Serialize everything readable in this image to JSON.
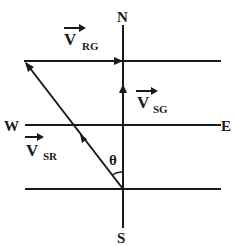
{
  "diagram": {
    "compass": {
      "north": "N",
      "south": "S",
      "east": "E",
      "west": "W"
    },
    "vectors": {
      "v_rg": {
        "letter": "V",
        "subscript": "RG"
      },
      "v_sg": {
        "letter": "V",
        "subscript": "SG"
      },
      "v_sr": {
        "letter": "V",
        "subscript": "SR"
      }
    },
    "angle_label": "θ",
    "colors": {
      "stroke": "#1a1a1a",
      "background": "#ffffff"
    }
  }
}
